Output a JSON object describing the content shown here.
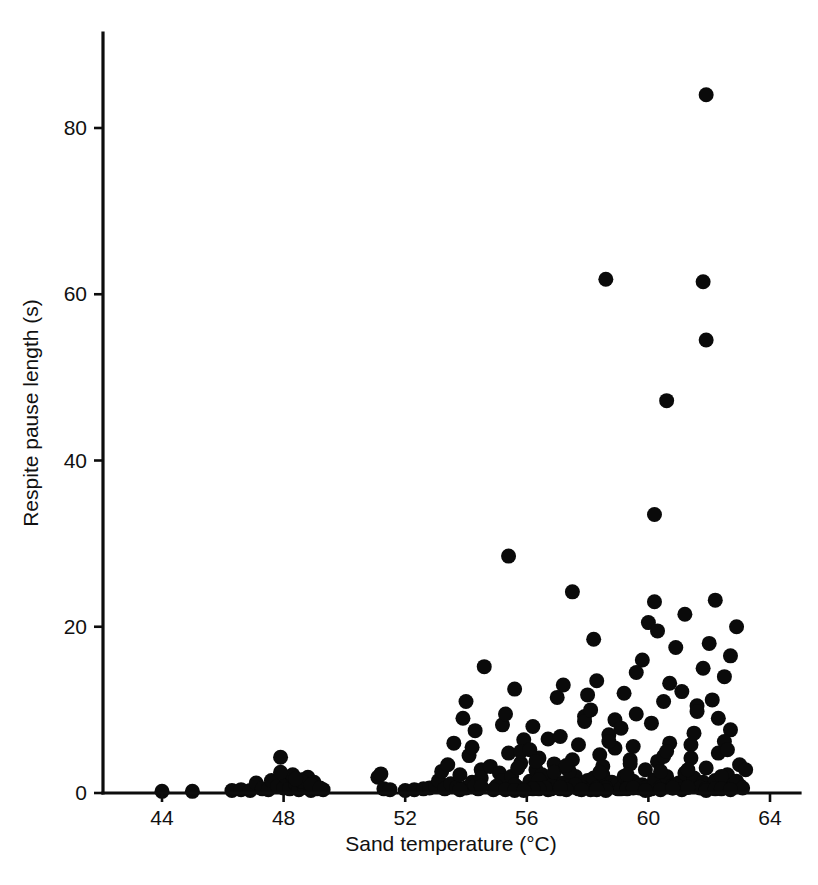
{
  "figure": {
    "background_color": "#ffffff",
    "point_color": "#0a0a0a",
    "axis_color": "#0d0d0d"
  },
  "axes": {
    "x_title": "Sand temperature (°C)",
    "y_title": "Respite pause length (s)",
    "x_ticks": [
      "44",
      "48",
      "52",
      "56",
      "60",
      "64"
    ],
    "y_ticks": [
      "0",
      "20",
      "40",
      "60",
      "80"
    ]
  },
  "chart_data": {
    "type": "scatter",
    "title": "",
    "subtitle": "",
    "xlabel": "Sand temperature (°C)",
    "ylabel": "Respite pause length (s)",
    "xlim": [
      42.6,
      65.0
    ],
    "ylim": [
      0,
      91
    ],
    "xticks": [
      44,
      48,
      52,
      56,
      60,
      64
    ],
    "yticks": [
      0,
      20,
      40,
      60,
      80
    ],
    "grid": false,
    "legend": null,
    "marker": "filled-circle",
    "marker_size_px": 15,
    "series": [
      {
        "name": "Respite pause length vs sand temperature",
        "x": [
          44.0,
          45.0,
          46.3,
          46.6,
          46.9,
          47.1,
          47.3,
          47.5,
          47.6,
          47.8,
          47.9,
          48.0,
          48.1,
          48.2,
          48.3,
          48.4,
          48.5,
          48.6,
          48.7,
          48.8,
          48.9,
          49.0,
          49.1,
          49.3,
          48.3,
          48.6,
          48.9,
          49.2,
          47.9,
          48.4,
          51.1,
          51.3,
          51.2,
          51.5,
          52.0,
          52.3,
          52.6,
          52.8,
          53.0,
          53.1,
          53.2,
          53.3,
          53.4,
          53.5,
          53.6,
          53.7,
          53.8,
          53.9,
          54.0,
          54.1,
          54.2,
          54.3,
          54.4,
          54.5,
          54.0,
          54.3,
          54.6,
          54.2,
          54.5,
          54.8,
          55.0,
          55.1,
          55.2,
          55.3,
          55.4,
          55.5,
          55.6,
          55.7,
          55.8,
          55.9,
          55.2,
          55.5,
          55.8,
          55.0,
          55.4,
          55.7,
          54.9,
          55.3,
          55.6,
          56.0,
          56.1,
          56.2,
          56.3,
          56.4,
          56.5,
          56.6,
          56.7,
          56.8,
          56.9,
          57.0,
          56.2,
          56.5,
          56.8,
          56.1,
          56.4,
          56.7,
          57.0,
          56.3,
          56.6,
          56.9,
          57.1,
          57.2,
          57.3,
          57.4,
          57.5,
          57.6,
          57.7,
          57.8,
          57.9,
          58.0,
          57.2,
          57.5,
          57.8,
          57.1,
          57.4,
          57.7,
          58.0,
          57.3,
          57.6,
          57.9,
          58.1,
          58.2,
          58.3,
          58.4,
          58.5,
          58.6,
          58.7,
          58.8,
          58.9,
          59.0,
          58.2,
          58.5,
          58.8,
          58.1,
          58.4,
          58.7,
          59.0,
          58.3,
          58.6,
          58.9,
          59.1,
          59.2,
          59.3,
          59.4,
          59.5,
          59.6,
          59.7,
          59.8,
          59.9,
          60.0,
          59.2,
          59.5,
          59.8,
          59.1,
          59.4,
          59.7,
          60.0,
          59.3,
          59.6,
          59.9,
          60.1,
          60.2,
          60.3,
          60.4,
          60.5,
          60.6,
          60.7,
          60.8,
          60.9,
          61.0,
          60.2,
          60.5,
          60.8,
          60.1,
          60.4,
          60.7,
          61.0,
          60.3,
          60.6,
          60.9,
          61.1,
          61.2,
          61.3,
          61.4,
          61.5,
          61.6,
          61.7,
          61.8,
          61.9,
          62.0,
          61.2,
          61.5,
          61.8,
          61.1,
          61.4,
          61.7,
          62.0,
          61.3,
          61.6,
          61.9,
          62.1,
          62.2,
          62.3,
          62.4,
          62.5,
          62.6,
          62.7,
          62.8,
          62.9,
          63.0,
          62.2,
          62.5,
          62.8,
          62.1,
          62.4,
          62.7,
          63.0,
          62.3,
          62.6,
          62.9,
          63.1,
          63.2,
          55.3,
          55.6,
          56.4,
          57.3,
          58.6,
          59.3,
          60.4,
          61.9,
          58.6,
          60.2,
          61.8,
          61.9,
          61.9,
          60.6,
          56.2,
          57.8,
          59.5,
          62.2,
          54.5,
          55.9,
          57.1,
          58.3,
          60.8,
          62.4,
          53.8,
          59.9,
          61.3,
          62.7
        ],
        "y": [
          0.2,
          0.2,
          0.3,
          0.4,
          0.3,
          1.2,
          0.5,
          0.4,
          1.5,
          0.8,
          4.3,
          0.6,
          1.8,
          0.5,
          2.0,
          1.1,
          0.4,
          1.6,
          0.7,
          1.9,
          0.3,
          1.3,
          0.5,
          0.4,
          2.2,
          1.4,
          1.0,
          0.6,
          2.5,
          1.7,
          1.9,
          0.5,
          2.3,
          0.4,
          0.3,
          0.4,
          0.5,
          0.6,
          0.8,
          1.5,
          2.6,
          0.5,
          3.4,
          1.1,
          6.0,
          0.7,
          2.2,
          9.0,
          0.6,
          4.5,
          1.3,
          7.5,
          0.5,
          2.8,
          11.0,
          0.9,
          15.2,
          5.5,
          1.8,
          3.2,
          0.6,
          2.4,
          8.2,
          0.5,
          4.8,
          1.2,
          12.5,
          0.7,
          3.6,
          6.4,
          1.5,
          2.0,
          5.0,
          0.8,
          28.5,
          3.0,
          0.4,
          9.5,
          1.0,
          0.5,
          1.4,
          0.6,
          2.8,
          4.2,
          0.7,
          1.8,
          6.5,
          0.5,
          3.5,
          1.1,
          8.0,
          2.2,
          0.9,
          5.2,
          1.6,
          0.4,
          11.5,
          3.8,
          0.6,
          2.5,
          0.5,
          1.2,
          3.0,
          0.8,
          24.2,
          2.0,
          5.8,
          0.6,
          9.2,
          1.5,
          13.0,
          4.0,
          0.7,
          6.8,
          2.6,
          0.5,
          11.8,
          3.3,
          1.0,
          8.6,
          0.4,
          1.8,
          0.6,
          4.6,
          2.2,
          0.9,
          7.0,
          1.3,
          5.4,
          0.5,
          18.5,
          3.2,
          0.8,
          10.0,
          2.5,
          6.2,
          1.1,
          13.5,
          0.6,
          8.8,
          0.5,
          2.0,
          0.7,
          4.0,
          1.4,
          9.5,
          0.6,
          16.0,
          2.8,
          0.4,
          12.0,
          5.6,
          1.0,
          7.8,
          3.5,
          0.8,
          20.5,
          2.2,
          14.5,
          0.6,
          0.5,
          1.6,
          3.8,
          0.7,
          11.0,
          2.0,
          6.0,
          0.9,
          17.5,
          1.2,
          23.0,
          4.4,
          0.6,
          8.4,
          2.6,
          13.2,
          0.8,
          19.5,
          5.0,
          1.0,
          0.4,
          2.4,
          0.7,
          5.8,
          1.8,
          10.5,
          0.6,
          15.0,
          3.0,
          0.9,
          21.5,
          7.2,
          1.3,
          12.2,
          4.2,
          0.7,
          18.0,
          2.8,
          9.8,
          0.5,
          0.6,
          1.5,
          4.8,
          0.8,
          14.0,
          2.2,
          7.6,
          1.0,
          20.0,
          3.4,
          23.2,
          6.2,
          0.7,
          11.2,
          2.0,
          16.5,
          0.9,
          9.0,
          5.2,
          1.4,
          0.6,
          2.8,
          0.4,
          0.3,
          0.5,
          0.4,
          0.3,
          0.5,
          0.4,
          0.3,
          61.8,
          33.5,
          61.5,
          84.0,
          54.5,
          47.2,
          0.5,
          0.4,
          0.6,
          0.5,
          0.8,
          0.3,
          0.7,
          0.4,
          0.6,
          0.5,
          0.4,
          0.3,
          0.7,
          0.4
        ]
      }
    ],
    "notable_points": [
      {
        "x": 61.9,
        "y": 84.0,
        "note": "highest respite pause"
      },
      {
        "x": 58.6,
        "y": 61.8,
        "note": "outlier"
      },
      {
        "x": 60.2,
        "y": 61.5,
        "note": "outlier"
      },
      {
        "x": 61.9,
        "y": 54.5,
        "note": "outlier"
      },
      {
        "x": 61.9,
        "y": 47.2,
        "note": "outlier"
      },
      {
        "x": 60.2,
        "y": 33.5,
        "note": "outlier"
      },
      {
        "x": 55.4,
        "y": 28.5,
        "note": "outlier"
      }
    ]
  }
}
